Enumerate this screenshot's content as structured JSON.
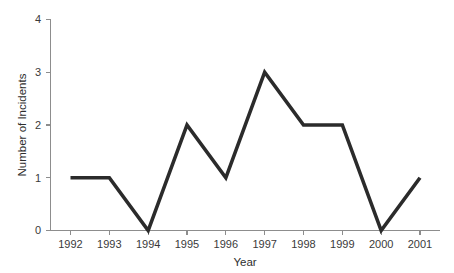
{
  "chart_data": {
    "type": "line",
    "title": "",
    "subtitle": "",
    "xlabel": "Year",
    "ylabel": "Number of Incidents",
    "categories": [
      "1992",
      "1993",
      "1994",
      "1995",
      "1996",
      "1997",
      "1998",
      "1999",
      "2000",
      "2001"
    ],
    "x": [
      1992,
      1993,
      1994,
      1995,
      1996,
      1997,
      1998,
      1999,
      2000,
      2001
    ],
    "values": [
      1,
      1,
      0,
      2,
      1,
      3,
      2,
      2,
      0,
      1
    ],
    "series": [
      {
        "name": "Number of Incidents",
        "values": [
          1,
          1,
          0,
          2,
          1,
          3,
          2,
          2,
          0,
          1
        ]
      }
    ],
    "xtick_labels": [
      "1992",
      "1993",
      "1994",
      "1995",
      "1996",
      "1997",
      "1998",
      "1999",
      "2000",
      "2001"
    ],
    "ytick_labels": [
      "0",
      "1",
      "2",
      "3",
      "4"
    ],
    "ytick_values": [
      0,
      1,
      2,
      3,
      4
    ],
    "ylim": [
      0,
      4
    ],
    "xlim": [
      1992,
      2001
    ],
    "grid": false,
    "legend": false,
    "legend_position": "none",
    "markers": false,
    "line_color": "#2b2b2b",
    "axis_color": "#8d8d8d",
    "background_color": "#ffffff",
    "annotations": []
  },
  "axes": {
    "y_title": "Number of Incidents",
    "x_title": "Year"
  },
  "ticks": {
    "y": [
      {
        "label": "4",
        "value": 4
      },
      {
        "label": "3",
        "value": 3
      },
      {
        "label": "2",
        "value": 2
      },
      {
        "label": "1",
        "value": 1
      },
      {
        "label": "0",
        "value": 0
      }
    ],
    "x": [
      {
        "label": "1992",
        "value": 1
      },
      {
        "label": "1993",
        "value": 1
      },
      {
        "label": "1994",
        "value": 0
      },
      {
        "label": "1995",
        "value": 2
      },
      {
        "label": "1996",
        "value": 1
      },
      {
        "label": "1997",
        "value": 3
      },
      {
        "label": "1998",
        "value": 2
      },
      {
        "label": "1999",
        "value": 2
      },
      {
        "label": "2000",
        "value": 0
      },
      {
        "label": "2001",
        "value": 1
      }
    ]
  }
}
